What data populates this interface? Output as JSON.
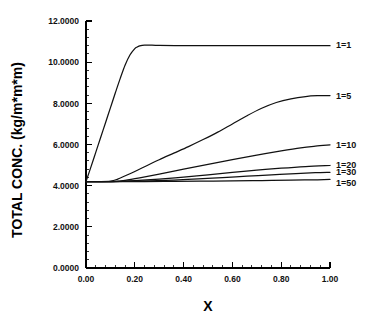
{
  "chart_data": {
    "type": "line",
    "title": "",
    "xlabel": "X",
    "ylabel": "TOTAL CONC. (kg/m*m*m)",
    "xlim": [
      0.0,
      1.0
    ],
    "ylim": [
      0.0,
      12.0
    ],
    "grid": false,
    "legend_position": "right-inline-labels",
    "x_ticks": [
      "0.00",
      "0.20",
      "0.40",
      "0.60",
      "0.80",
      "1.00"
    ],
    "x_tick_values": [
      0.0,
      0.2,
      0.4,
      0.6,
      0.8,
      1.0
    ],
    "y_ticks": [
      "0.0000",
      "2.0000",
      "4.0000",
      "6.0000",
      "8.0000",
      "10.0000",
      "12.0000"
    ],
    "y_tick_values": [
      0,
      2,
      4,
      6,
      8,
      10,
      12
    ],
    "x_minor_per_major": 5,
    "y_minor_per_major": 5,
    "baseline_value": 4.2,
    "series": [
      {
        "name": "1=1",
        "label": "1=1",
        "color": "#111111",
        "label_x": 1.0,
        "label_y": 10.8,
        "x": [
          0.0,
          0.02,
          0.04,
          0.06,
          0.08,
          0.1,
          0.12,
          0.14,
          0.16,
          0.18,
          0.2,
          0.21,
          0.22,
          0.23,
          0.24,
          0.26,
          0.3,
          0.4,
          0.5,
          0.6,
          0.7,
          0.8,
          0.9,
          1.0
        ],
        "y": [
          4.2,
          4.9,
          5.62,
          6.34,
          7.06,
          7.78,
          8.5,
          9.2,
          9.85,
          10.35,
          10.66,
          10.74,
          10.79,
          10.82,
          10.83,
          10.83,
          10.81,
          10.8,
          10.8,
          10.8,
          10.8,
          10.8,
          10.8,
          10.8
        ]
      },
      {
        "name": "1=5",
        "label": "1=5",
        "color": "#111111",
        "label_x": 1.0,
        "label_y": 8.35,
        "x": [
          0.0,
          0.05,
          0.1,
          0.13,
          0.18,
          0.24,
          0.3,
          0.36,
          0.42,
          0.48,
          0.54,
          0.6,
          0.66,
          0.72,
          0.78,
          0.84,
          0.9,
          0.95,
          1.0
        ],
        "y": [
          4.2,
          4.2,
          4.22,
          4.32,
          4.58,
          4.92,
          5.26,
          5.58,
          5.9,
          6.24,
          6.6,
          7.0,
          7.4,
          7.76,
          8.04,
          8.22,
          8.33,
          8.37,
          8.38
        ]
      },
      {
        "name": "1=10",
        "label": "1=10",
        "color": "#111111",
        "label_x": 1.0,
        "label_y": 5.95,
        "x": [
          0.0,
          0.06,
          0.12,
          0.16,
          0.22,
          0.3,
          0.4,
          0.5,
          0.6,
          0.7,
          0.8,
          0.88,
          0.94,
          1.0
        ],
        "y": [
          4.2,
          4.2,
          4.21,
          4.26,
          4.38,
          4.56,
          4.8,
          5.03,
          5.26,
          5.48,
          5.69,
          5.84,
          5.92,
          5.98
        ]
      },
      {
        "name": "1=20",
        "label": "1=20",
        "color": "#111111",
        "label_x": 1.0,
        "label_y": 4.95,
        "x": [
          0.0,
          0.08,
          0.14,
          0.2,
          0.3,
          0.4,
          0.5,
          0.6,
          0.7,
          0.8,
          0.9,
          1.0
        ],
        "y": [
          4.2,
          4.2,
          4.21,
          4.24,
          4.32,
          4.42,
          4.53,
          4.64,
          4.75,
          4.85,
          4.93,
          4.98
        ]
      },
      {
        "name": "1=30",
        "label": "1=30",
        "color": "#111111",
        "label_x": 1.0,
        "label_y": 4.62,
        "x": [
          0.0,
          0.1,
          0.18,
          0.26,
          0.36,
          0.46,
          0.56,
          0.66,
          0.76,
          0.86,
          0.94,
          1.0
        ],
        "y": [
          4.2,
          4.2,
          4.21,
          4.23,
          4.27,
          4.33,
          4.39,
          4.46,
          4.53,
          4.59,
          4.63,
          4.65
        ]
      },
      {
        "name": "1=50",
        "label": "1=50",
        "color": "#111111",
        "label_x": 1.0,
        "label_y": 4.1,
        "x": [
          0.0,
          0.12,
          0.24,
          0.36,
          0.48,
          0.6,
          0.72,
          0.84,
          0.92,
          1.0
        ],
        "y": [
          4.2,
          4.2,
          4.2,
          4.21,
          4.22,
          4.23,
          4.25,
          4.27,
          4.28,
          4.3
        ]
      }
    ]
  },
  "plot": {
    "left_px": 86,
    "right_px": 330,
    "top_px": 21,
    "bottom_px": 268
  }
}
